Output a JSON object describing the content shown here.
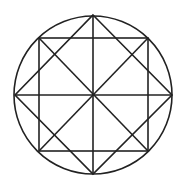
{
  "diagram": {
    "stroke_color": "#222222",
    "background": "#ffffff",
    "circle": {
      "cx": 93,
      "cy": 95,
      "r": 79
    },
    "square": {
      "x1": 39,
      "y1": 38,
      "x2": 148,
      "y2": 151
    },
    "diamond": {
      "top": [
        93,
        15
      ],
      "right": [
        172,
        95
      ],
      "bottom": [
        93,
        174
      ],
      "left": [
        15,
        95
      ]
    }
  }
}
